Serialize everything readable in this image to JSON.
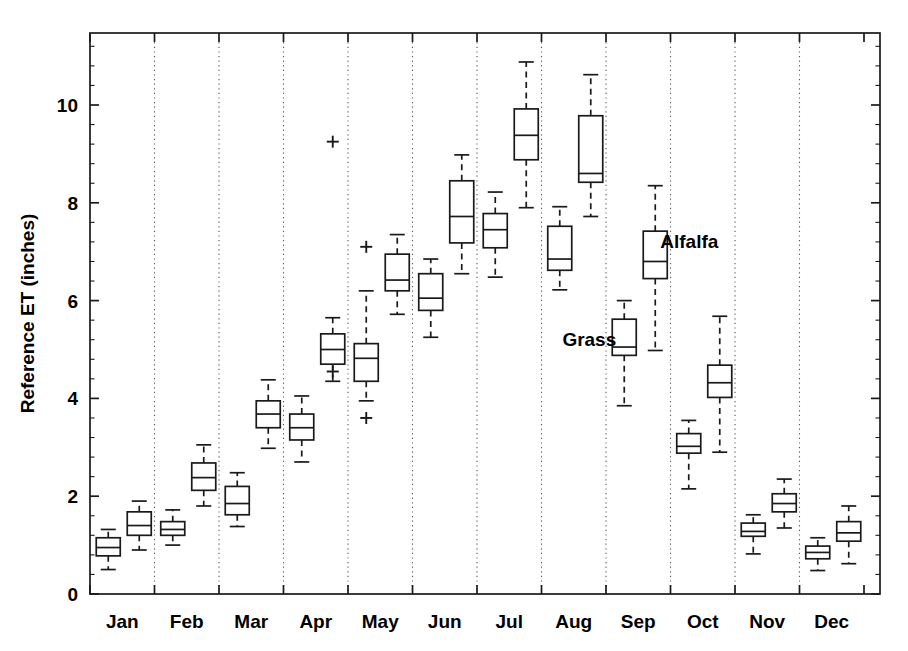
{
  "chart_data": {
    "type": "box",
    "title": "",
    "xlabel": "",
    "ylabel": "Reference ET (inches)",
    "ylim": [
      0,
      11.4
    ],
    "yticks": [
      0,
      2,
      4,
      6,
      8,
      10
    ],
    "ytick_labels": [
      "0",
      "2",
      "4",
      "6",
      "8",
      "10"
    ],
    "xlim": [
      0,
      12
    ],
    "categories": [
      "Jan",
      "Feb",
      "Mar",
      "Apr",
      "May",
      "Jun",
      "Jul",
      "Aug",
      "Sep",
      "Oct",
      "Nov",
      "Dec"
    ],
    "grid": "vertical-dotted-at-month-boundaries",
    "legend": "inline-text-labels",
    "annotations": [
      {
        "text": "Alfalfa",
        "x_month": "Sep",
        "y_value": 7.2
      },
      {
        "text": "Grass",
        "x_month": "Sep",
        "y_value": 5.2
      }
    ],
    "series": [
      {
        "name": "Grass",
        "boxes": [
          {
            "month": "Jan",
            "whisker_low": 0.5,
            "q1": 0.78,
            "median": 0.95,
            "q3": 1.15,
            "whisker_high": 1.32,
            "outliers": []
          },
          {
            "month": "Feb",
            "whisker_low": 1.0,
            "q1": 1.2,
            "median": 1.32,
            "q3": 1.48,
            "whisker_high": 1.72,
            "outliers": []
          },
          {
            "month": "Mar",
            "whisker_low": 1.38,
            "q1": 1.62,
            "median": 1.85,
            "q3": 2.2,
            "whisker_high": 2.48,
            "outliers": []
          },
          {
            "month": "Apr",
            "whisker_low": 2.7,
            "q1": 3.15,
            "median": 3.4,
            "q3": 3.68,
            "whisker_high": 4.05,
            "outliers": []
          },
          {
            "month": "May",
            "whisker_low": 3.95,
            "q1": 4.35,
            "median": 4.82,
            "q3": 5.12,
            "whisker_high": 6.2,
            "outliers": [
              3.6,
              7.1
            ]
          },
          {
            "month": "Jun",
            "whisker_low": 5.25,
            "q1": 5.8,
            "median": 6.05,
            "q3": 6.55,
            "whisker_high": 6.85,
            "outliers": []
          },
          {
            "month": "Jul",
            "whisker_low": 6.48,
            "q1": 7.08,
            "median": 7.45,
            "q3": 7.78,
            "whisker_high": 8.22,
            "outliers": []
          },
          {
            "month": "Aug",
            "whisker_low": 6.22,
            "q1": 6.62,
            "median": 6.85,
            "q3": 7.52,
            "whisker_high": 7.92,
            "outliers": []
          },
          {
            "month": "Sep",
            "whisker_low": 3.85,
            "q1": 4.88,
            "median": 5.05,
            "q3": 5.62,
            "whisker_high": 6.0,
            "outliers": []
          },
          {
            "month": "Oct",
            "whisker_low": 2.15,
            "q1": 2.88,
            "median": 3.02,
            "q3": 3.28,
            "whisker_high": 3.55,
            "outliers": []
          },
          {
            "month": "Nov",
            "whisker_low": 0.82,
            "q1": 1.18,
            "median": 1.28,
            "q3": 1.45,
            "whisker_high": 1.62,
            "outliers": []
          },
          {
            "month": "Dec",
            "whisker_low": 0.48,
            "q1": 0.72,
            "median": 0.85,
            "q3": 0.98,
            "whisker_high": 1.15,
            "outliers": []
          }
        ]
      },
      {
        "name": "Alfalfa",
        "boxes": [
          {
            "month": "Jan",
            "whisker_low": 0.9,
            "q1": 1.2,
            "median": 1.4,
            "q3": 1.68,
            "whisker_high": 1.9,
            "outliers": []
          },
          {
            "month": "Feb",
            "whisker_low": 1.8,
            "q1": 2.12,
            "median": 2.38,
            "q3": 2.68,
            "whisker_high": 3.05,
            "outliers": []
          },
          {
            "month": "Mar",
            "whisker_low": 2.98,
            "q1": 3.4,
            "median": 3.68,
            "q3": 3.95,
            "whisker_high": 4.38,
            "outliers": []
          },
          {
            "month": "Apr",
            "whisker_low": 4.35,
            "q1": 4.7,
            "median": 5.0,
            "q3": 5.32,
            "whisker_high": 5.65,
            "outliers": [
              4.55,
              9.25
            ]
          },
          {
            "month": "May",
            "whisker_low": 5.72,
            "q1": 6.2,
            "median": 6.42,
            "q3": 6.95,
            "whisker_high": 7.35,
            "outliers": []
          },
          {
            "month": "Jun",
            "whisker_low": 6.55,
            "q1": 7.18,
            "median": 7.72,
            "q3": 8.45,
            "whisker_high": 8.98,
            "outliers": []
          },
          {
            "month": "Jul",
            "whisker_low": 7.9,
            "q1": 8.88,
            "median": 9.38,
            "q3": 9.92,
            "whisker_high": 10.88,
            "outliers": []
          },
          {
            "month": "Aug",
            "whisker_low": 7.72,
            "q1": 8.42,
            "median": 8.6,
            "q3": 9.78,
            "whisker_high": 10.62,
            "outliers": []
          },
          {
            "month": "Sep",
            "whisker_low": 4.98,
            "q1": 6.45,
            "median": 6.8,
            "q3": 7.42,
            "whisker_high": 8.35,
            "outliers": []
          },
          {
            "month": "Oct",
            "whisker_low": 2.9,
            "q1": 4.02,
            "median": 4.32,
            "q3": 4.68,
            "whisker_high": 5.68,
            "outliers": []
          },
          {
            "month": "Nov",
            "whisker_low": 1.35,
            "q1": 1.68,
            "median": 1.85,
            "q3": 2.05,
            "whisker_high": 2.35,
            "outliers": []
          },
          {
            "month": "Dec",
            "whisker_low": 0.62,
            "q1": 1.08,
            "median": 1.25,
            "q3": 1.48,
            "whisker_high": 1.8,
            "outliers": []
          }
        ]
      }
    ]
  },
  "geometry": {
    "plot_left": 90,
    "plot_right": 880,
    "plot_top": 33,
    "plot_bottom": 594,
    "y_zero_px": 594,
    "y_unit_px": 48.9,
    "month_slot_px": 64.5,
    "grass_offset_px": -14,
    "alfalfa_offset_px": 17,
    "box_half_width_px": 12
  }
}
